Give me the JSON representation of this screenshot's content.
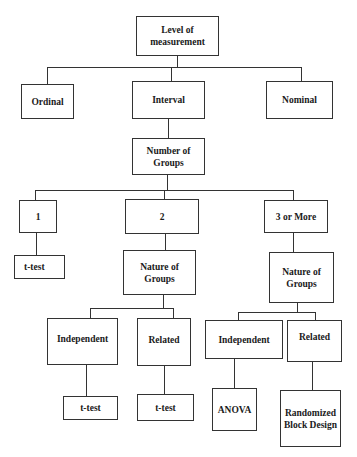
{
  "diagram": {
    "type": "decision-tree",
    "root": {
      "label": "Level of measurement"
    },
    "level1": [
      {
        "label": "Ordinal"
      },
      {
        "label": "Interval"
      },
      {
        "label": "Nominal"
      }
    ],
    "number_of_groups": {
      "label": "Number of Groups"
    },
    "groups": [
      {
        "label": "1",
        "result": "t-test"
      },
      {
        "label": "2"
      },
      {
        "label": "3 or More"
      }
    ],
    "two_groups": {
      "nature": {
        "label": "Nature of Groups"
      },
      "independent": {
        "label": "Independent",
        "result": "t-test"
      },
      "related": {
        "label": "Related",
        "result": "t-test"
      }
    },
    "three_or_more_groups": {
      "nature": {
        "label": "Nature of Groups"
      },
      "independent": {
        "label": "Independent",
        "result": "ANOVA"
      },
      "related": {
        "label": "Related",
        "result": "Randomized Block Design"
      }
    }
  }
}
